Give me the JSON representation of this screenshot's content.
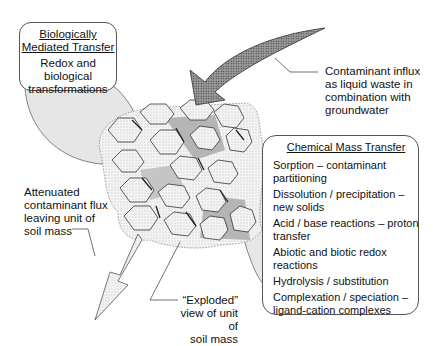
{
  "diagram": {
    "biological_box": {
      "title_line1": "Biologically",
      "title_line2": "Mediated Transfer",
      "body_line1": "Redox and",
      "body_line2": "biological",
      "body_line3": "transformations"
    },
    "chemical_box": {
      "title": "Chemical Mass Transfer",
      "items": [
        {
          "line1": "Sorption – contaminant",
          "line2": "partitioning"
        },
        {
          "line1": "Dissolution / precipitation –",
          "line2": "new solids"
        },
        {
          "line1": "Acid / base reactions – proton",
          "line2": "transfer"
        },
        {
          "line1": "Abiotic and biotic redox",
          "line2": "reactions"
        },
        {
          "line1": "Hydrolysis / substitution",
          "line2": ""
        },
        {
          "line1": "Complexation / speciation –",
          "line2": "ligand-cation complexes"
        }
      ]
    },
    "influx_label": {
      "line1": "Contaminant influx",
      "line2": "as liquid waste in",
      "line3": "combination with",
      "line4": "groundwater"
    },
    "outflux_label": {
      "line1": "Attenuated",
      "line2": "contaminant flux",
      "line3": "leaving unit of",
      "line4": "soil mass"
    },
    "exploded_label": {
      "line1": "“Exploded”",
      "line2": "view of unit of",
      "line3": "soil mass"
    },
    "colors": {
      "bubble_fill": "#e8e8e8",
      "pore_fill": "#b8b8b8",
      "outline": "#444444"
    }
  }
}
